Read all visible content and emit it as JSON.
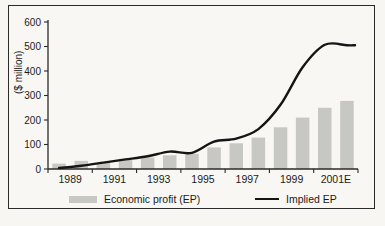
{
  "chart_data": {
    "type": "bar+line combo",
    "title": "",
    "ylabel": "($ million)",
    "xlabel": "",
    "ylim": [
      0,
      600
    ],
    "ytick_step": 100,
    "yticks": [
      600,
      500,
      400,
      300,
      200,
      100,
      0
    ],
    "categories": [
      "1989",
      "1990",
      "1991",
      "1992",
      "1993",
      "1994",
      "1995",
      "1996",
      "1997",
      "1998",
      "1999",
      "2000",
      "2001E",
      "2002E"
    ],
    "xtick_labels": [
      "1989",
      "1991",
      "1993",
      "1995",
      "1997",
      "1999",
      "2001E"
    ],
    "grid": false,
    "legend_position": "bottom",
    "series": [
      {
        "name": "Economic profit (EP)",
        "type": "bar",
        "color": "#c7c7c3",
        "values": [
          22,
          33,
          26,
          38,
          47,
          56,
          62,
          88,
          105,
          128,
          170,
          210,
          250,
          278
        ]
      },
      {
        "name": "Implied EP",
        "type": "line",
        "color": "#151515",
        "values": [
          4,
          13,
          26,
          39,
          52,
          71,
          66,
          112,
          124,
          163,
          262,
          415,
          507,
          505
        ]
      }
    ]
  },
  "axis": {
    "y_title": "($ million)"
  },
  "legend": {
    "bar_label": "Economic profit (EP)",
    "line_label": "Implied EP"
  },
  "colors": {
    "bar_fill": "#c7c7c3",
    "line_stroke": "#151515",
    "axis_stroke": "#2b2b2b",
    "paper": "#f8f7f4"
  }
}
